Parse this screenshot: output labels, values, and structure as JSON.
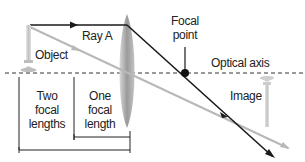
{
  "diagram": {
    "type": "convex-lens-ray-diagram",
    "labels": {
      "ray_a": "Ray A",
      "object": "Object",
      "focal_point_line1": "Focal",
      "focal_point_line2": "point",
      "optical_axis": "Optical axis",
      "image": "Image",
      "two_focal_line1": "Two",
      "two_focal_line2": "focal",
      "two_focal_line3": "lengths",
      "one_focal_line1": "One",
      "one_focal_line2": "focal",
      "one_focal_line3": "length"
    },
    "colors": {
      "ray_a": "#1a1a1a",
      "ray_center": "#b5b5b5",
      "lens": "#a8a8a8",
      "axis": "#333333",
      "candle": "#c8c8c8",
      "text": "#222222"
    },
    "elements": [
      {
        "id": "object",
        "kind": "upright candle"
      },
      {
        "id": "lens",
        "kind": "convex lens"
      },
      {
        "id": "focal-point",
        "kind": "dot on optical axis"
      },
      {
        "id": "image",
        "kind": "inverted candle"
      },
      {
        "id": "ray-a",
        "kind": "ray parallel to axis, refracted through focal point"
      },
      {
        "id": "center-ray",
        "kind": "ray through lens center, undeviated"
      }
    ]
  }
}
